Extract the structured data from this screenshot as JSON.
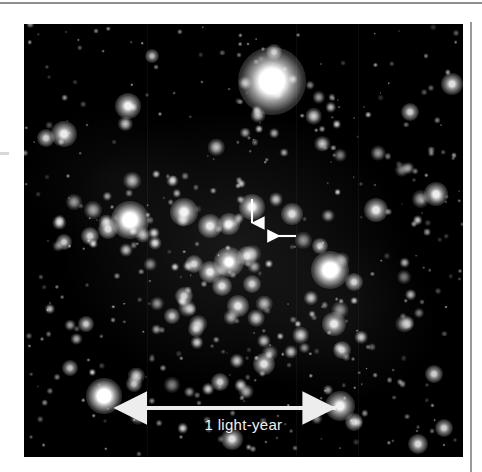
{
  "figure": {
    "type": "astronomical-photograph",
    "background_color": "#000000",
    "page_color": "#ffffff",
    "annotation_color": "#f2f2f2"
  },
  "scalebar": {
    "label": "1 light-year",
    "style": "double-headed-arrow",
    "x_start_px": 111,
    "x_end_px": 324,
    "y_px": 384,
    "color": "#ededed"
  },
  "pointers": [
    {
      "name": "down-arrow",
      "direction": "down",
      "tail_x_px": 228,
      "tail_y_px": 175,
      "tip_x_px": 228,
      "tip_y_px": 205,
      "color": "#ffffff"
    },
    {
      "name": "left-arrow",
      "direction": "left",
      "tail_x_px": 272,
      "tail_y_px": 212,
      "tip_x_px": 238,
      "tip_y_px": 212,
      "color": "#ffffff"
    }
  ],
  "photo_frame": {
    "left_px": 24,
    "top_px": 24,
    "width_px": 439,
    "height_px": 433
  },
  "rules": {
    "top_rule_color": "#8e8e8e",
    "right_rule_color": "#9a9a9a"
  },
  "chart_data": {
    "type": "scatter",
    "title": "",
    "xlabel": "",
    "ylabel": "",
    "xlim": [
      0,
      439
    ],
    "ylim": [
      0,
      433
    ],
    "grid": false,
    "legend": "none",
    "note": "Star positions (x,y in photo pixels) and relative brightness r (glow radius, px). Brightness b is 0-1 peak intensity.",
    "stars": [
      {
        "x": 248,
        "y": 57,
        "r": 34,
        "b": 1.0
      },
      {
        "x": 104,
        "y": 82,
        "r": 13,
        "b": 0.95
      },
      {
        "x": 40,
        "y": 110,
        "r": 13,
        "b": 0.92
      },
      {
        "x": 22,
        "y": 114,
        "r": 9,
        "b": 0.8
      },
      {
        "x": 106,
        "y": 196,
        "r": 19,
        "b": 1.0
      },
      {
        "x": 84,
        "y": 205,
        "r": 10,
        "b": 0.85
      },
      {
        "x": 66,
        "y": 212,
        "r": 9,
        "b": 0.8
      },
      {
        "x": 40,
        "y": 218,
        "r": 8,
        "b": 0.78
      },
      {
        "x": 160,
        "y": 188,
        "r": 14,
        "b": 0.95
      },
      {
        "x": 186,
        "y": 202,
        "r": 12,
        "b": 0.9
      },
      {
        "x": 205,
        "y": 200,
        "r": 11,
        "b": 0.88
      },
      {
        "x": 228,
        "y": 183,
        "r": 13,
        "b": 0.95
      },
      {
        "x": 268,
        "y": 190,
        "r": 11,
        "b": 0.85
      },
      {
        "x": 205,
        "y": 238,
        "r": 15,
        "b": 1.0
      },
      {
        "x": 186,
        "y": 248,
        "r": 11,
        "b": 0.9
      },
      {
        "x": 170,
        "y": 240,
        "r": 9,
        "b": 0.82
      },
      {
        "x": 223,
        "y": 232,
        "r": 10,
        "b": 0.85
      },
      {
        "x": 198,
        "y": 262,
        "r": 10,
        "b": 0.85
      },
      {
        "x": 214,
        "y": 282,
        "r": 11,
        "b": 0.88
      },
      {
        "x": 228,
        "y": 260,
        "r": 9,
        "b": 0.8
      },
      {
        "x": 160,
        "y": 272,
        "r": 9,
        "b": 0.8
      },
      {
        "x": 148,
        "y": 292,
        "r": 8,
        "b": 0.75
      },
      {
        "x": 172,
        "y": 305,
        "r": 8,
        "b": 0.75
      },
      {
        "x": 306,
        "y": 246,
        "r": 19,
        "b": 1.0
      },
      {
        "x": 330,
        "y": 258,
        "r": 9,
        "b": 0.82
      },
      {
        "x": 296,
        "y": 222,
        "r": 8,
        "b": 0.78
      },
      {
        "x": 352,
        "y": 186,
        "r": 12,
        "b": 0.9
      },
      {
        "x": 412,
        "y": 170,
        "r": 12,
        "b": 0.9
      },
      {
        "x": 428,
        "y": 60,
        "r": 11,
        "b": 0.88
      },
      {
        "x": 386,
        "y": 88,
        "r": 9,
        "b": 0.8
      },
      {
        "x": 250,
        "y": 28,
        "r": 8,
        "b": 0.75
      },
      {
        "x": 128,
        "y": 32,
        "r": 7,
        "b": 0.7
      },
      {
        "x": 62,
        "y": 300,
        "r": 8,
        "b": 0.78
      },
      {
        "x": 46,
        "y": 344,
        "r": 8,
        "b": 0.75
      },
      {
        "x": 80,
        "y": 372,
        "r": 18,
        "b": 1.0
      },
      {
        "x": 110,
        "y": 360,
        "r": 8,
        "b": 0.75
      },
      {
        "x": 316,
        "y": 382,
        "r": 15,
        "b": 0.95
      },
      {
        "x": 330,
        "y": 398,
        "r": 9,
        "b": 0.8
      },
      {
        "x": 310,
        "y": 300,
        "r": 12,
        "b": 0.9
      },
      {
        "x": 318,
        "y": 326,
        "r": 9,
        "b": 0.8
      },
      {
        "x": 240,
        "y": 340,
        "r": 11,
        "b": 0.88
      },
      {
        "x": 196,
        "y": 358,
        "r": 9,
        "b": 0.8
      },
      {
        "x": 208,
        "y": 415,
        "r": 11,
        "b": 0.88
      },
      {
        "x": 394,
        "y": 420,
        "r": 10,
        "b": 0.85
      },
      {
        "x": 420,
        "y": 404,
        "r": 9,
        "b": 0.8
      },
      {
        "x": 410,
        "y": 350,
        "r": 9,
        "b": 0.8
      }
    ]
  }
}
